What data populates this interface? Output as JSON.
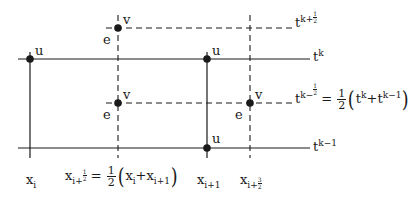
{
  "diagram": {
    "type": "staggered-grid",
    "colors": {
      "ink": "#1a1a1a",
      "background": "#ffffff"
    },
    "time_levels": [
      {
        "id": "t_k_plus_half",
        "base": "t",
        "sup_text": "k+",
        "sup_frac_num": "1",
        "sup_frac_den": "2",
        "style": "dashed"
      },
      {
        "id": "t_k",
        "base": "t",
        "sup_text": "k",
        "style": "solid"
      },
      {
        "id": "t_k_minus_half",
        "base": "t",
        "sup_text": "k−",
        "sup_frac_num": "1",
        "sup_frac_den": "2",
        "style": "dashed",
        "equation": {
          "equals": "=",
          "coef_num": "1",
          "coef_den": "2",
          "open": "(",
          "term1_base": "t",
          "term1_sup": "k",
          "plus": "+",
          "term2_base": "t",
          "term2_sup": "k−1",
          "close": ")"
        }
      },
      {
        "id": "t_k_minus_1",
        "base": "t",
        "sup_text": "k−1",
        "style": "solid"
      }
    ],
    "space_levels": [
      {
        "id": "x_i",
        "base": "x",
        "sub_text": "i",
        "style": "solid"
      },
      {
        "id": "x_i_plus_half",
        "base": "x",
        "sub_text": "i+",
        "sub_frac_num": "1",
        "sub_frac_den": "2",
        "style": "dashed",
        "equation": {
          "equals": "=",
          "coef_num": "1",
          "coef_den": "2",
          "open": "(",
          "term1_base": "x",
          "term1_sub": "i",
          "plus": "+",
          "term2_base": "x",
          "term2_sub": "i+1",
          "close": ")"
        }
      },
      {
        "id": "x_i_plus_1",
        "base": "x",
        "sub_text": "i+1",
        "style": "solid"
      },
      {
        "id": "x_i_plus_3_half",
        "base": "x",
        "sub_text": "i+",
        "sub_frac_num": "3",
        "sub_frac_den": "2",
        "style": "dashed"
      }
    ],
    "nodes": [
      {
        "label": "u",
        "at": "x_i, t_k"
      },
      {
        "label": "u",
        "at": "x_i+1, t_k"
      },
      {
        "label": "u",
        "at": "x_i+1, t_k-1"
      },
      {
        "label": "v",
        "at": "x_i+1/2, t_k+1/2",
        "side_label": "e"
      },
      {
        "label": "v",
        "at": "x_i+1/2, t_k-1/2",
        "side_label": "e"
      },
      {
        "label": "v",
        "at": "x_i+3/2, t_k-1/2",
        "side_label": "e"
      }
    ]
  }
}
